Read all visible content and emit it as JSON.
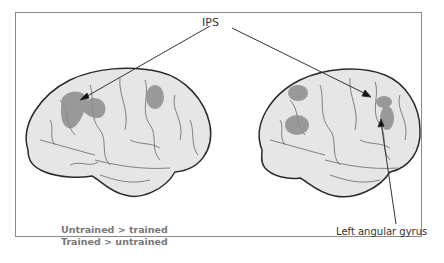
{
  "figure": {
    "callouts": {
      "top": "IPS",
      "bottom_right": "Left angular gyrus"
    },
    "legend": [
      {
        "label": "Untrained > trained"
      },
      {
        "label": "Trained > untrained"
      }
    ],
    "brains": [
      {
        "id": "left-brain",
        "view": "lateral",
        "activations": [
          "IPS cluster",
          "superior parietal cluster",
          "frontal cluster"
        ]
      },
      {
        "id": "right-brain",
        "view": "lateral",
        "activations": [
          "frontal cluster upper",
          "frontal cluster lower",
          "IPS cluster",
          "angular gyrus cluster"
        ]
      }
    ],
    "colors": {
      "brain_fill": "#e6e6e6",
      "brain_outline": "#2a2a2a",
      "sulci": "#555555",
      "activation": "#8c8c8c",
      "frame": "#8a8a8a"
    }
  }
}
